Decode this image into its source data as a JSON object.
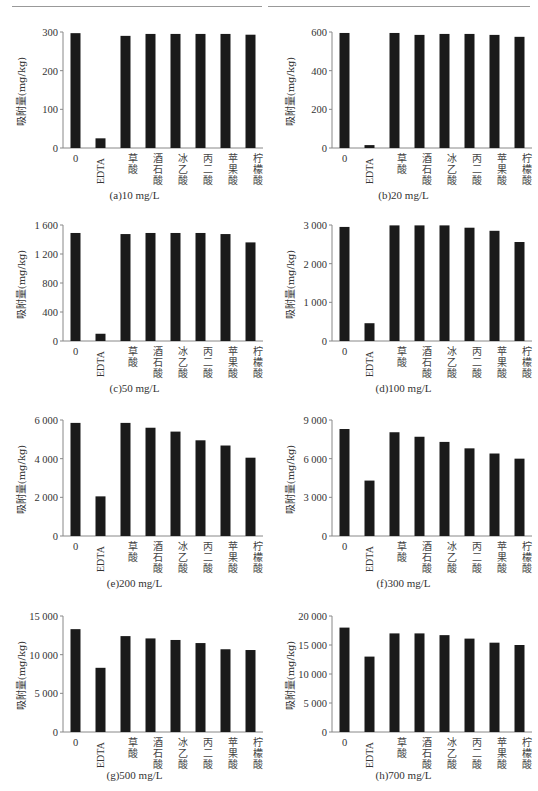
{
  "figure": {
    "ylabel": "吸附量(mg/kg)",
    "categories": [
      "0",
      "EDTA",
      "草酸",
      "酒石酸",
      "冰乙酸",
      "丙二酸",
      "苹果酸",
      "柠檬酸"
    ],
    "bar_color": "#1a1a1a",
    "axis_color": "#888888"
  },
  "chart_data": [
    {
      "type": "bar",
      "title": "(a)10 mg/L",
      "xlabel": "",
      "ylabel": "吸附量(mg/kg)",
      "categories": [
        "0",
        "EDTA",
        "草酸",
        "酒石酸",
        "冰乙酸",
        "丙二酸",
        "苹果酸",
        "柠檬酸"
      ],
      "values": [
        297,
        25,
        290,
        295,
        295,
        295,
        295,
        293
      ],
      "ylim": [
        0,
        300
      ],
      "yticks": [
        0,
        100,
        200,
        300
      ],
      "ytick_labels": [
        "0",
        "100",
        "200",
        "300"
      ],
      "grid": false,
      "legend": null
    },
    {
      "type": "bar",
      "title": "(b)20 mg/L",
      "xlabel": "",
      "ylabel": "吸附量(mg/kg)",
      "categories": [
        "0",
        "EDTA",
        "草酸",
        "酒石酸",
        "冰乙酸",
        "丙二酸",
        "苹果酸",
        "柠檬酸"
      ],
      "values": [
        595,
        15,
        595,
        585,
        590,
        590,
        585,
        575
      ],
      "ylim": [
        0,
        600
      ],
      "yticks": [
        0,
        200,
        400,
        600
      ],
      "ytick_labels": [
        "0",
        "200",
        "400",
        "600"
      ],
      "grid": false,
      "legend": null
    },
    {
      "type": "bar",
      "title": "(c)50 mg/L",
      "xlabel": "",
      "ylabel": "吸附量(mg/kg)",
      "categories": [
        "0",
        "EDTA",
        "草酸",
        "酒石酸",
        "冰乙酸",
        "丙二酸",
        "苹果酸",
        "柠檬酸"
      ],
      "values": [
        1490,
        100,
        1475,
        1490,
        1490,
        1490,
        1475,
        1360
      ],
      "ylim": [
        0,
        1600
      ],
      "yticks": [
        0,
        400,
        800,
        1200,
        1600
      ],
      "ytick_labels": [
        "0",
        "400",
        "800",
        "1 200",
        "1 600"
      ],
      "grid": false,
      "legend": null
    },
    {
      "type": "bar",
      "title": "(d)100 mg/L",
      "xlabel": "",
      "ylabel": "吸附量(mg/kg)",
      "categories": [
        "0",
        "EDTA",
        "草酸",
        "酒石酸",
        "冰乙酸",
        "丙二酸",
        "苹果酸",
        "柠檬酸"
      ],
      "values": [
        2950,
        460,
        2990,
        2990,
        2990,
        2930,
        2850,
        2560
      ],
      "ylim": [
        0,
        3000
      ],
      "yticks": [
        0,
        1000,
        2000,
        3000
      ],
      "ytick_labels": [
        "0",
        "1 000",
        "2 000",
        "3 000"
      ],
      "grid": false,
      "legend": null
    },
    {
      "type": "bar",
      "title": "(e)200 mg/L",
      "xlabel": "",
      "ylabel": "吸附量(mg/kg)",
      "categories": [
        "0",
        "EDTA",
        "草酸",
        "酒石酸",
        "冰乙酸",
        "丙二酸",
        "苹果酸",
        "柠檬酸"
      ],
      "values": [
        5850,
        2050,
        5850,
        5600,
        5400,
        4950,
        4680,
        4050
      ],
      "ylim": [
        0,
        6000
      ],
      "yticks": [
        0,
        2000,
        4000,
        6000
      ],
      "ytick_labels": [
        "0",
        "2 000",
        "4 000",
        "6 000"
      ],
      "grid": false,
      "legend": null
    },
    {
      "type": "bar",
      "title": "(f)300 mg/L",
      "xlabel": "",
      "ylabel": "吸附量(mg/kg)",
      "categories": [
        "0",
        "EDTA",
        "草酸",
        "酒石酸",
        "冰乙酸",
        "丙二酸",
        "苹果酸",
        "柠檬酸"
      ],
      "values": [
        8300,
        4300,
        8050,
        7700,
        7300,
        6800,
        6400,
        6000
      ],
      "ylim": [
        0,
        9000
      ],
      "yticks": [
        0,
        3000,
        6000,
        9000
      ],
      "ytick_labels": [
        "0",
        "3 000",
        "6 000",
        "9 000"
      ],
      "grid": false,
      "legend": null
    },
    {
      "type": "bar",
      "title": "(g)500 mg/L",
      "xlabel": "",
      "ylabel": "吸附量(mg/kg)",
      "categories": [
        "0",
        "EDTA",
        "草酸",
        "酒石酸",
        "冰乙酸",
        "丙二酸",
        "苹果酸",
        "柠檬酸"
      ],
      "values": [
        13300,
        8300,
        12400,
        12100,
        11900,
        11500,
        10700,
        10600
      ],
      "ylim": [
        0,
        15000
      ],
      "yticks": [
        0,
        5000,
        10000,
        15000
      ],
      "ytick_labels": [
        "0",
        "5 000",
        "10 000",
        "15 000"
      ],
      "grid": false,
      "legend": null
    },
    {
      "type": "bar",
      "title": "(h)700 mg/L",
      "xlabel": "",
      "ylabel": "吸附量(mg/kg)",
      "categories": [
        "0",
        "EDTA",
        "草酸",
        "酒石酸",
        "冰乙酸",
        "丙二酸",
        "苹果酸",
        "柠檬酸"
      ],
      "values": [
        18000,
        13000,
        17000,
        17000,
        16700,
        16100,
        15400,
        15000
      ],
      "ylim": [
        0,
        20000
      ],
      "yticks": [
        0,
        5000,
        10000,
        15000,
        20000
      ],
      "ytick_labels": [
        "0",
        "5 000",
        "10 000",
        "15 000",
        "20 000"
      ],
      "grid": false,
      "legend": null
    }
  ]
}
